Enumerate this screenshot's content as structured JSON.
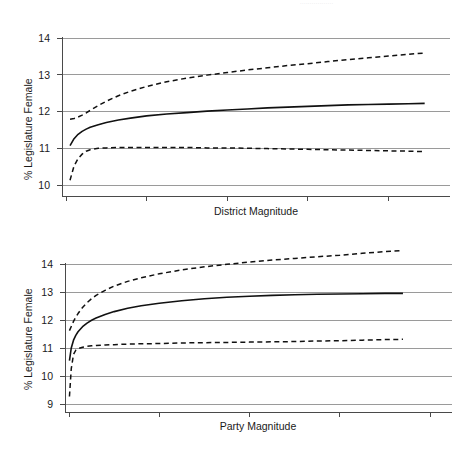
{
  "page_header": {
    "text": "·················"
  },
  "colors": {
    "gridline": "#9a9a9a",
    "axis": "#4a4a4a",
    "curve": "#111111",
    "background": "#ffffff"
  },
  "chart_data": [
    {
      "id": "district-magnitude",
      "type": "line",
      "title": "",
      "xlabel": "District Magnitude",
      "ylabel": "% Legislature Female",
      "xlim": [
        -1.5,
        96
      ],
      "ylim": [
        9.72,
        14.3
      ],
      "xticks": [
        0,
        20,
        40,
        60,
        80
      ],
      "yticks": [
        10,
        11,
        12,
        13,
        14
      ],
      "grid": true,
      "legend": "none",
      "series": [
        {
          "name": "Upper confidence bound",
          "style": "dashed",
          "x": [
            1,
            2,
            3,
            4,
            5,
            6,
            8,
            10,
            13,
            16,
            20,
            25,
            30,
            35,
            40,
            45,
            50,
            55,
            60,
            65,
            70,
            75,
            80,
            85,
            89
          ],
          "y": [
            11.79,
            11.81,
            11.85,
            11.9,
            11.96,
            12.03,
            12.16,
            12.28,
            12.43,
            12.55,
            12.68,
            12.81,
            12.91,
            12.99,
            13.06,
            13.13,
            13.19,
            13.25,
            13.3,
            13.36,
            13.41,
            13.46,
            13.51,
            13.56,
            13.59
          ]
        },
        {
          "name": "Predicted value",
          "style": "solid",
          "x": [
            1,
            2,
            3,
            4,
            5,
            6,
            8,
            10,
            13,
            16,
            20,
            25,
            30,
            35,
            40,
            45,
            50,
            55,
            60,
            65,
            70,
            75,
            80,
            85,
            89
          ],
          "y": [
            11.07,
            11.26,
            11.38,
            11.46,
            11.52,
            11.57,
            11.64,
            11.7,
            11.77,
            11.82,
            11.88,
            11.93,
            11.97,
            12.01,
            12.04,
            12.07,
            12.1,
            12.12,
            12.14,
            12.16,
            12.18,
            12.19,
            12.2,
            12.21,
            12.22
          ]
        },
        {
          "name": "Lower confidence bound",
          "style": "dashed",
          "x": [
            1,
            2,
            3,
            4,
            5,
            6,
            8,
            10,
            13,
            16,
            20,
            25,
            30,
            35,
            40,
            45,
            50,
            55,
            60,
            65,
            70,
            75,
            80,
            85,
            89
          ],
          "y": [
            10.13,
            10.52,
            10.72,
            10.84,
            10.92,
            10.96,
            11.0,
            11.01,
            11.02,
            11.02,
            11.02,
            11.02,
            11.02,
            11.01,
            11.01,
            11.0,
            10.99,
            10.98,
            10.97,
            10.96,
            10.95,
            10.94,
            10.93,
            10.92,
            10.91
          ]
        }
      ]
    },
    {
      "id": "party-magnitude",
      "type": "line",
      "title": "",
      "xlabel": "Party Magnitude",
      "ylabel": "% Legislature Female",
      "xlim": [
        -1.5,
        84
      ],
      "ylim": [
        8.7,
        14.75
      ],
      "xticks": [
        0,
        20,
        40,
        60,
        80
      ],
      "yticks": [
        9,
        10,
        11,
        12,
        13,
        14
      ],
      "grid": true,
      "legend": "none",
      "series": [
        {
          "name": "Upper confidence bound",
          "style": "dashed",
          "x": [
            0.1,
            0.5,
            1,
            1.5,
            2,
            3,
            4,
            5,
            6,
            8,
            10,
            13,
            16,
            20,
            25,
            30,
            35,
            40,
            45,
            50,
            55,
            60,
            65,
            70,
            74
          ],
          "y": [
            11.62,
            11.77,
            11.95,
            12.1,
            12.23,
            12.45,
            12.62,
            12.76,
            12.88,
            13.06,
            13.21,
            13.38,
            13.51,
            13.65,
            13.79,
            13.9,
            13.99,
            14.07,
            14.14,
            14.2,
            14.26,
            14.31,
            14.38,
            14.44,
            14.48
          ]
        },
        {
          "name": "Predicted value",
          "style": "solid",
          "x": [
            0.1,
            0.5,
            1,
            1.5,
            2,
            3,
            4,
            5,
            6,
            8,
            10,
            13,
            16,
            20,
            25,
            30,
            35,
            40,
            45,
            50,
            55,
            60,
            65,
            70,
            74
          ],
          "y": [
            10.55,
            11.0,
            11.28,
            11.45,
            11.58,
            11.76,
            11.89,
            11.99,
            12.07,
            12.2,
            12.3,
            12.42,
            12.51,
            12.6,
            12.69,
            12.76,
            12.81,
            12.85,
            12.88,
            12.9,
            12.92,
            12.93,
            12.94,
            12.95,
            12.95
          ]
        },
        {
          "name": "Lower confidence bound",
          "style": "dashed",
          "x": [
            0.1,
            0.5,
            1,
            1.5,
            2,
            3,
            4,
            5,
            6,
            8,
            10,
            13,
            16,
            20,
            25,
            30,
            35,
            40,
            45,
            50,
            55,
            60,
            65,
            70,
            74
          ],
          "y": [
            9.27,
            10.26,
            10.77,
            10.92,
            10.98,
            11.03,
            11.06,
            11.08,
            11.09,
            11.11,
            11.12,
            11.14,
            11.15,
            11.16,
            11.18,
            11.19,
            11.2,
            11.21,
            11.22,
            11.23,
            11.25,
            11.26,
            11.28,
            11.3,
            11.31
          ]
        }
      ]
    }
  ]
}
